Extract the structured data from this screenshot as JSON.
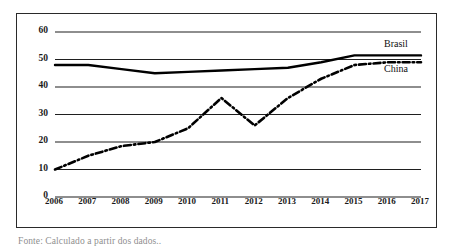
{
  "caption": "Fonte: Calculado a partir dos dados..",
  "chart_data": {
    "type": "line",
    "title": "",
    "subtitle": "",
    "xlabel": "",
    "ylabel": "",
    "x": [
      2006,
      2007,
      2008,
      2009,
      2010,
      2011,
      2012,
      2013,
      2014,
      2015,
      2016,
      2017
    ],
    "categories": [
      "2006",
      "2007",
      "2008",
      "2009",
      "2010",
      "2011",
      "2012",
      "2013",
      "2014",
      "2015",
      "2016",
      "2017"
    ],
    "xlim": [
      2006,
      2017
    ],
    "ylim": [
      0,
      60
    ],
    "yticks": [
      0,
      10,
      20,
      30,
      40,
      50,
      60
    ],
    "ytick_labels": [
      "0",
      "10",
      "20",
      "30",
      "40",
      "50",
      "60"
    ],
    "grid": "horizontal",
    "legend_position": "inline-right",
    "series": [
      {
        "name": "Brasil",
        "style": "solid",
        "color": "#000000",
        "values": [
          48,
          48,
          46.5,
          45,
          45.5,
          46,
          46.5,
          47,
          49,
          51.5,
          51.5,
          51.5
        ]
      },
      {
        "name": "China",
        "style": "dash-dot",
        "color": "#000000",
        "values": [
          10,
          15,
          18.5,
          20,
          25,
          36,
          26,
          36,
          43,
          48,
          49,
          49
        ]
      }
    ],
    "annotations": [
      {
        "text": "Brasil",
        "x": 2017,
        "y": 55
      },
      {
        "text": "China",
        "x": 2017,
        "y": 46
      }
    ]
  }
}
